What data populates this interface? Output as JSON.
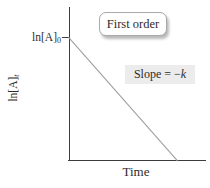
{
  "figure": {
    "title_box": "First order",
    "slope": {
      "prefix": "Slope = −",
      "variable": "k"
    },
    "x_axis_label": "Time",
    "y_axis_label": {
      "base": "ln[A]",
      "sub": "t"
    },
    "y_intercept": {
      "base": "ln[A]",
      "sub": "0"
    }
  },
  "colors": {
    "background": "#ffffff",
    "axis": "#3d3d3d",
    "data_line": "#9b9b9b",
    "text": "#2f2b29",
    "slope_highlight_bg": "#ececec",
    "badge_border": "#a9a9a9"
  },
  "chart_data": {
    "type": "line",
    "qualitative": true,
    "title": "First order",
    "xlabel": "Time",
    "ylabel": "ln[A]_t",
    "y_intercept_label": "ln[A]_0",
    "slope_annotation": "Slope = −k",
    "grid": false,
    "legend": false,
    "series": [
      {
        "name": "ln[A]_t vs Time (first-order decay)",
        "x_fraction": [
          0.0,
          0.79
        ],
        "y_fraction": [
          1.0,
          0.0
        ],
        "slope": "−k",
        "shape": "straight line decreasing from y-intercept ln[A]_0 to the x-axis"
      }
    ]
  }
}
